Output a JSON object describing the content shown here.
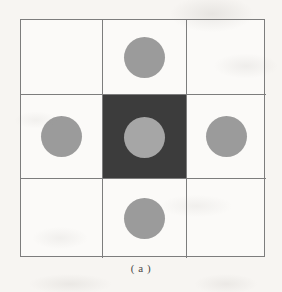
{
  "figure": {
    "caption": "( a )",
    "type": "3x3-grid-diagram",
    "grid": {
      "rows": 3,
      "cols": 3,
      "border_color": "#7d7d7d",
      "cell_background": "#fbfaf8",
      "filled_cell_color": "#3c3c3c",
      "dot_color": "#9b9b9b",
      "dot_color_on_dark": "#a6a6a6"
    },
    "cells": [
      {
        "id": "cell-r1c1",
        "row": 1,
        "col": 1,
        "filled": false,
        "dot": false
      },
      {
        "id": "cell-r1c2",
        "row": 1,
        "col": 2,
        "filled": false,
        "dot": true
      },
      {
        "id": "cell-r1c3",
        "row": 1,
        "col": 3,
        "filled": false,
        "dot": false
      },
      {
        "id": "cell-r2c1",
        "row": 2,
        "col": 1,
        "filled": false,
        "dot": true
      },
      {
        "id": "cell-r2c2",
        "row": 2,
        "col": 2,
        "filled": true,
        "dot": true
      },
      {
        "id": "cell-r2c3",
        "row": 2,
        "col": 3,
        "filled": false,
        "dot": true
      },
      {
        "id": "cell-r3c1",
        "row": 3,
        "col": 1,
        "filled": false,
        "dot": false
      },
      {
        "id": "cell-r3c2",
        "row": 3,
        "col": 2,
        "filled": false,
        "dot": true
      },
      {
        "id": "cell-r3c3",
        "row": 3,
        "col": 3,
        "filled": false,
        "dot": false
      }
    ]
  },
  "page": {
    "background_color": "#f7f5f2"
  }
}
